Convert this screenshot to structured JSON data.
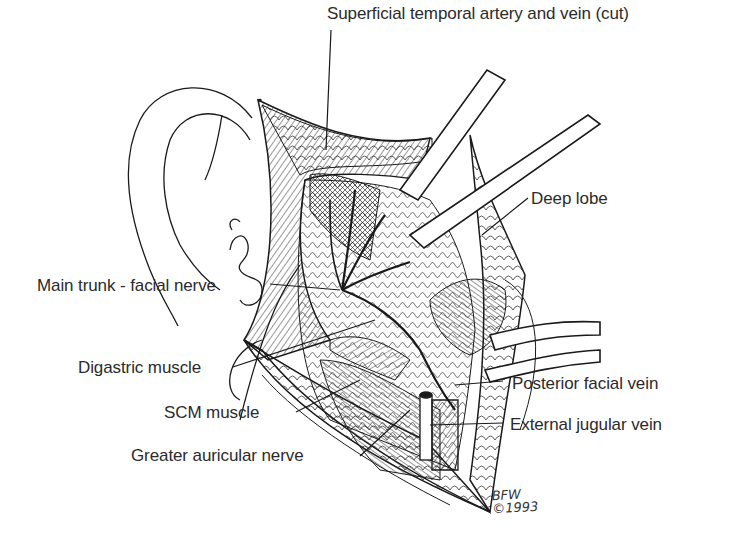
{
  "figure": {
    "ink_color": "#1a1a1a",
    "background": "#ffffff"
  },
  "labels": [
    {
      "id": "superficial-temporal",
      "text": "Superficial temporal artery and vein (cut)",
      "x": 327,
      "y": 5
    },
    {
      "id": "deep-lobe",
      "text": "Deep lobe",
      "x": 531,
      "y": 190
    },
    {
      "id": "main-trunk-facial-nerve",
      "text": "Main trunk - facial nerve",
      "x": 37,
      "y": 277
    },
    {
      "id": "digastric-muscle",
      "text": "Digastric muscle",
      "x": 78,
      "y": 359
    },
    {
      "id": "posterior-facial-vein",
      "text": "Posterior facial vein",
      "x": 512,
      "y": 375
    },
    {
      "id": "scm-muscle",
      "text": "SCM muscle",
      "x": 164,
      "y": 404
    },
    {
      "id": "external-jugular-vein",
      "text": "External jugular vein",
      "x": 510,
      "y": 416
    },
    {
      "id": "greater-auricular-nerve",
      "text": "Greater auricular nerve",
      "x": 131,
      "y": 447
    }
  ],
  "signature": {
    "initials": "BFW",
    "copyright": "©1993"
  }
}
